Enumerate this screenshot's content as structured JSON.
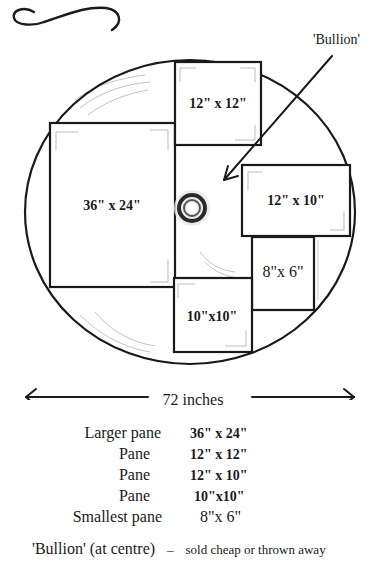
{
  "diagram": {
    "bullion_callout": "'Bullion'",
    "panes": [
      {
        "id": "larger",
        "label": "36\" x 24\"",
        "style": "bold"
      },
      {
        "id": "pane-12x12",
        "label": "12\" x 12\"",
        "style": "bold"
      },
      {
        "id": "pane-12x10",
        "label": "12\" x 10\"",
        "style": "bold"
      },
      {
        "id": "smallest",
        "label": "8\"x 6\"",
        "style": "light"
      },
      {
        "id": "pane-10x10",
        "label": "10\"x10\"",
        "style": "bold"
      }
    ],
    "scale": {
      "label": "72 inches"
    }
  },
  "legend": {
    "rows": [
      {
        "name": "Larger pane",
        "size": "36\" x 24\""
      },
      {
        "name": "Pane",
        "size": "12\" x 12\""
      },
      {
        "name": "Pane",
        "size": "12\" x 10\""
      },
      {
        "name": "Pane",
        "size": "10\"x10\""
      },
      {
        "name": "Smallest pane",
        "size": "8\"x 6\""
      }
    ],
    "note": {
      "name": "'Bullion' (at centre)",
      "separator": "–",
      "text": "sold cheap or thrown away"
    }
  },
  "colors": {
    "ink": "#1a1a1a",
    "pencil": "#b5b5b5",
    "background": "#ffffff"
  }
}
